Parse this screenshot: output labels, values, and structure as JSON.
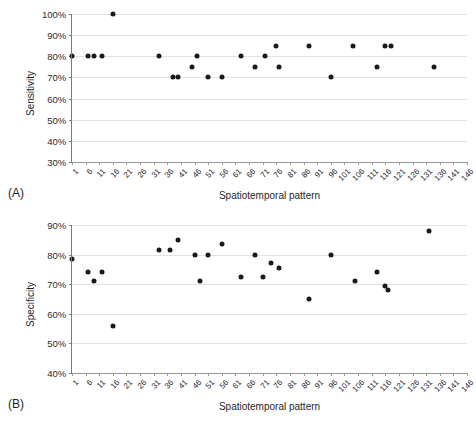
{
  "figure": {
    "panels": [
      {
        "tag": "(A)",
        "chart_data": {
          "type": "scatter",
          "title": "",
          "xlabel": "Spatiotemporal pattern",
          "ylabel": "Sensitivity",
          "xlim": [
            1,
            146
          ],
          "ylim": [
            0.3,
            1.0
          ],
          "ytick_labels": [
            "30%",
            "40%",
            "50%",
            "60%",
            "70%",
            "80%",
            "90%",
            "100%"
          ],
          "ytick_values": [
            0.3,
            0.4,
            0.5,
            0.6,
            0.7,
            0.8,
            0.9,
            1.0
          ],
          "xtick_labels": [
            "1",
            "6",
            "11",
            "16",
            "21",
            "26",
            "31",
            "36",
            "41",
            "46",
            "51",
            "56",
            "61",
            "66",
            "71",
            "76",
            "81",
            "86",
            "91",
            "96",
            "101",
            "106",
            "111",
            "116",
            "121",
            "126",
            "131",
            "136",
            "141",
            "146"
          ],
          "xtick_values": [
            1,
            6,
            11,
            16,
            21,
            26,
            31,
            36,
            41,
            46,
            51,
            56,
            61,
            66,
            71,
            76,
            81,
            86,
            91,
            96,
            101,
            106,
            111,
            116,
            121,
            126,
            131,
            136,
            141,
            146
          ],
          "grid": true,
          "legend": null,
          "points": [
            {
              "x": 1,
              "y": 0.8
            },
            {
              "x": 7,
              "y": 0.8
            },
            {
              "x": 9,
              "y": 0.8
            },
            {
              "x": 12,
              "y": 0.8
            },
            {
              "x": 16,
              "y": 1.0
            },
            {
              "x": 33,
              "y": 0.8
            },
            {
              "x": 38,
              "y": 0.7
            },
            {
              "x": 40,
              "y": 0.7
            },
            {
              "x": 45,
              "y": 0.75
            },
            {
              "x": 47,
              "y": 0.8
            },
            {
              "x": 51,
              "y": 0.7
            },
            {
              "x": 56,
              "y": 0.7
            },
            {
              "x": 63,
              "y": 0.8
            },
            {
              "x": 68,
              "y": 0.75
            },
            {
              "x": 72,
              "y": 0.8
            },
            {
              "x": 76,
              "y": 0.85
            },
            {
              "x": 77,
              "y": 0.75
            },
            {
              "x": 88,
              "y": 0.85
            },
            {
              "x": 96,
              "y": 0.7
            },
            {
              "x": 104,
              "y": 0.85
            },
            {
              "x": 113,
              "y": 0.75
            },
            {
              "x": 116,
              "y": 0.85
            },
            {
              "x": 118,
              "y": 0.85
            },
            {
              "x": 134,
              "y": 0.75
            }
          ]
        }
      },
      {
        "tag": "(B)",
        "chart_data": {
          "type": "scatter",
          "title": "",
          "xlabel": "Spatiotemporal pattern",
          "ylabel": "Specificity",
          "xlim": [
            1,
            146
          ],
          "ylim": [
            0.4,
            0.9
          ],
          "ytick_labels": [
            "40%",
            "50%",
            "60%",
            "70%",
            "80%",
            "90%"
          ],
          "ytick_values": [
            0.4,
            0.5,
            0.6,
            0.7,
            0.8,
            0.9
          ],
          "xtick_labels": [
            "1",
            "6",
            "11",
            "16",
            "21",
            "26",
            "31",
            "36",
            "41",
            "46",
            "51",
            "56",
            "61",
            "66",
            "71",
            "76",
            "81",
            "86",
            "91",
            "96",
            "101",
            "106",
            "111",
            "116",
            "121",
            "126",
            "131",
            "136",
            "141",
            "146"
          ],
          "xtick_values": [
            1,
            6,
            11,
            16,
            21,
            26,
            31,
            36,
            41,
            46,
            51,
            56,
            61,
            66,
            71,
            76,
            81,
            86,
            91,
            96,
            101,
            106,
            111,
            116,
            121,
            126,
            131,
            136,
            141,
            146
          ],
          "grid": true,
          "legend": null,
          "points": [
            {
              "x": 1,
              "y": 0.785
            },
            {
              "x": 7,
              "y": 0.74
            },
            {
              "x": 9,
              "y": 0.71
            },
            {
              "x": 12,
              "y": 0.74
            },
            {
              "x": 16,
              "y": 0.56
            },
            {
              "x": 33,
              "y": 0.815
            },
            {
              "x": 37,
              "y": 0.815
            },
            {
              "x": 40,
              "y": 0.85
            },
            {
              "x": 46,
              "y": 0.8
            },
            {
              "x": 48,
              "y": 0.71
            },
            {
              "x": 51,
              "y": 0.8
            },
            {
              "x": 56,
              "y": 0.835
            },
            {
              "x": 63,
              "y": 0.725
            },
            {
              "x": 68,
              "y": 0.8
            },
            {
              "x": 71,
              "y": 0.725
            },
            {
              "x": 74,
              "y": 0.77
            },
            {
              "x": 77,
              "y": 0.755
            },
            {
              "x": 88,
              "y": 0.65
            },
            {
              "x": 96,
              "y": 0.8
            },
            {
              "x": 105,
              "y": 0.71
            },
            {
              "x": 113,
              "y": 0.74
            },
            {
              "x": 116,
              "y": 0.695
            },
            {
              "x": 117,
              "y": 0.68
            },
            {
              "x": 132,
              "y": 0.88
            }
          ]
        }
      }
    ]
  }
}
